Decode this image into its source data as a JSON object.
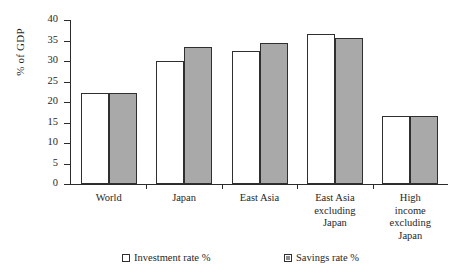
{
  "chart_data": {
    "type": "bar",
    "title": "",
    "xlabel": "",
    "ylabel": "% of GDP",
    "ylim": [
      0,
      40
    ],
    "yticks": [
      0,
      5,
      10,
      15,
      20,
      25,
      30,
      35,
      40
    ],
    "grid": false,
    "legend_position": "bottom",
    "categories": [
      "World",
      "Japan",
      "East Asia",
      "East Asia excluding Japan",
      "High income excluding Japan"
    ],
    "category_lines": [
      [
        "World"
      ],
      [
        "Japan"
      ],
      [
        "East Asia"
      ],
      [
        "East Asia",
        "excluding",
        "Japan"
      ],
      [
        "High",
        "income",
        "excluding",
        "Japan"
      ]
    ],
    "series": [
      {
        "name": "Investment rate %",
        "color": "#ffffff",
        "values": [
          22.2,
          30.0,
          32.5,
          36.7,
          16.6
        ]
      },
      {
        "name": "Savings rate %",
        "color": "#a9a9a9",
        "values": [
          22.2,
          33.3,
          34.5,
          35.6,
          16.6
        ]
      }
    ]
  },
  "axis": {
    "y_title": "% of GDP",
    "tick_labels": [
      "40",
      "35",
      "30",
      "25",
      "20",
      "15",
      "10",
      "5",
      "0"
    ]
  },
  "legend": {
    "items": [
      {
        "label": "Investment rate %",
        "swatch": "open-square-icon"
      },
      {
        "label": "Savings rate %",
        "swatch": "filled-square-icon"
      }
    ]
  }
}
